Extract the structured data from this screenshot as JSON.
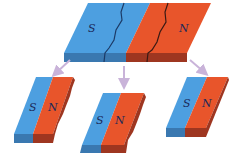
{
  "diagram": {
    "colors": {
      "south_top": "#4d9fe0",
      "south_side": "#3a78b0",
      "north_top": "#e8552b",
      "north_side": "#9e3620",
      "arrow": "#c9b3d9",
      "crack": "#1c3a66"
    },
    "original_magnet": {
      "south_label": "S",
      "north_label": "N"
    },
    "pieces": [
      {
        "south_label": "S",
        "north_label": "N"
      },
      {
        "south_label": "S",
        "north_label": "N"
      },
      {
        "south_label": "S",
        "north_label": "N"
      }
    ]
  }
}
